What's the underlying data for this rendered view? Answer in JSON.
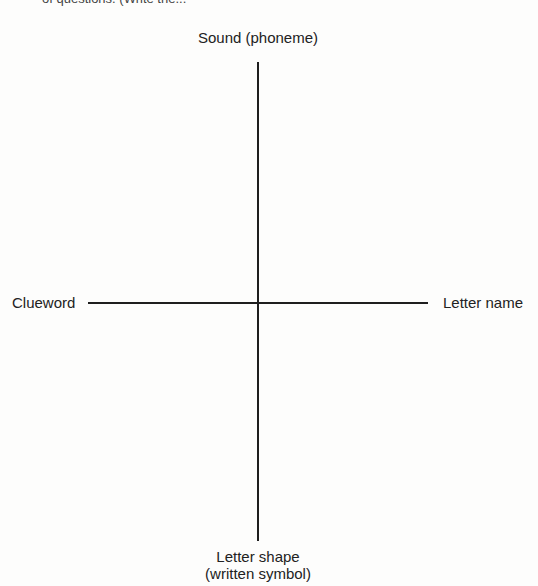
{
  "header": {
    "clipped_text": "of questions. (Write the..."
  },
  "diagram": {
    "type": "four-axis cross",
    "axis_color": "#1e1e1e",
    "labels": {
      "top": "Sound (phoneme)",
      "left": "Clueword",
      "right": "Letter name",
      "bottom_line1": "Letter shape",
      "bottom_line2": "(written symbol)"
    }
  }
}
